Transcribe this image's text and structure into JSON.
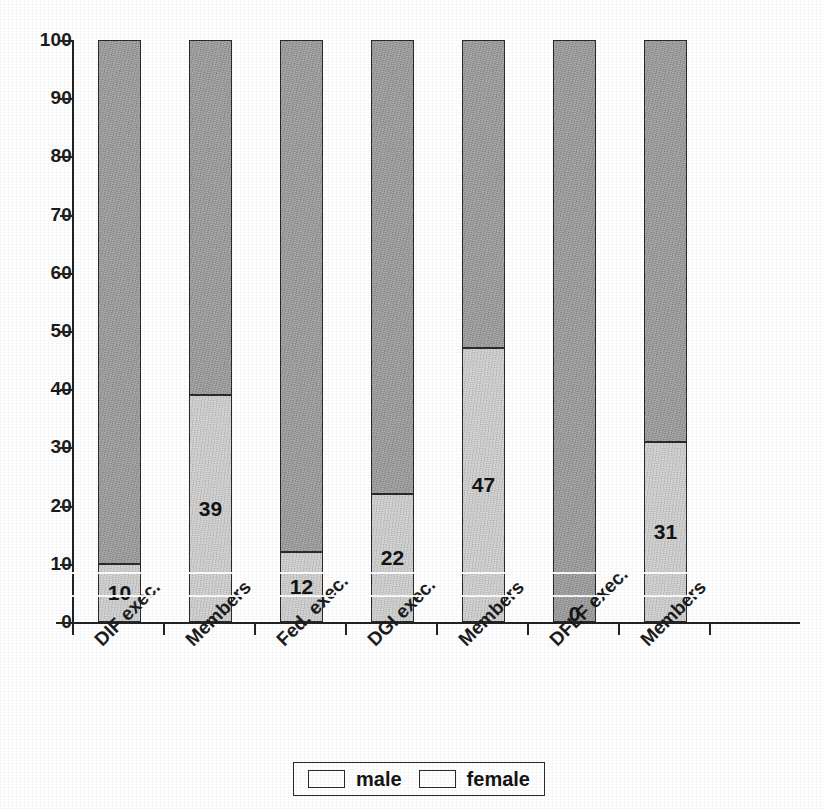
{
  "chart_data": {
    "type": "bar",
    "subtype": "stacked-100-percent",
    "title": "",
    "xlabel": "",
    "ylabel": "",
    "ylim": [
      0,
      100
    ],
    "y_ticks": [
      0,
      10,
      20,
      30,
      40,
      50,
      60,
      70,
      80,
      90,
      100
    ],
    "grid": false,
    "legend_position": "bottom-center",
    "categories": [
      "DIF exec.",
      "Members",
      "Fed. exec.",
      "DGI exec.",
      "Members",
      "DFLF exec.",
      "Members"
    ],
    "series": [
      {
        "name": "female",
        "color": "#cccccc",
        "values": [
          10,
          39,
          12,
          22,
          47,
          0,
          31
        ],
        "labels": [
          "10",
          "39",
          "12",
          "22",
          "47",
          "0",
          "31"
        ]
      },
      {
        "name": "male",
        "color": "#9a9a9a",
        "values": [
          90,
          61,
          88,
          78,
          53,
          100,
          69
        ],
        "labels": [
          "",
          "",
          "",
          "",
          "",
          "",
          ""
        ]
      }
    ]
  },
  "legend": {
    "entries": [
      {
        "label": "male",
        "color": "#9a9a9a"
      },
      {
        "label": "female",
        "color": "#cccccc"
      }
    ]
  },
  "axis": {
    "y_tick_labels": [
      "100",
      "90",
      "80",
      "70",
      "60",
      "50",
      "40",
      "30",
      "20",
      "10",
      "0"
    ]
  }
}
